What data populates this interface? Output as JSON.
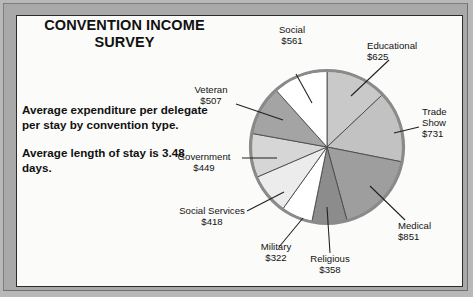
{
  "chart_data": {
    "type": "pie",
    "title": "CONVENTION INCOME SURVEY",
    "categories": [
      "Educational",
      "Trade Show",
      "Medical",
      "Religious",
      "Military",
      "Social Services",
      "Government",
      "Veteran",
      "Social"
    ],
    "values": [
      625,
      731,
      851,
      358,
      322,
      418,
      449,
      507,
      561
    ],
    "value_prefix": "$",
    "total": 4822,
    "xlabel": "",
    "ylabel": "",
    "legend": "none",
    "grid": false,
    "start_angle_deg": 0,
    "direction": "clockwise",
    "slice_colors": [
      "#c9c9c9",
      "#c2c2c2",
      "#9e9e9e",
      "#8c8c8c",
      "#ffffff",
      "#ececec",
      "#d6d6d6",
      "#a4a4a4",
      "#ffffff"
    ],
    "labels": [
      {
        "name": "Educational",
        "value": "$625"
      },
      {
        "name": "Trade Show",
        "value": "$731"
      },
      {
        "name": "Medical",
        "value": "$851"
      },
      {
        "name": "Religious",
        "value": "$358"
      },
      {
        "name": "Military",
        "value": "$322"
      },
      {
        "name": "Social Services",
        "value": "$418"
      },
      {
        "name": "Government",
        "value": "$449"
      },
      {
        "name": "Veteran",
        "value": "$507"
      },
      {
        "name": "Social",
        "value": "$561"
      }
    ],
    "annotations": [
      "Average expenditure per delegate per stay by convention type.",
      "Average length of stay is 3.48 days."
    ]
  },
  "header": {
    "title_line1": "CONVENTION INCOME",
    "title_line2": "SURVEY"
  },
  "caption": {
    "paragraph1": "Average expenditure per delegate per stay by convention type.",
    "paragraph2": "Average length of stay is 3.48 days."
  },
  "callouts": {
    "social": "Social\n$561",
    "educational": "Educational\n$625",
    "trade_show": "Trade\nShow\n$731",
    "medical": "Medical\n$851",
    "religious": "Religious\n$358",
    "military": "Military\n$322",
    "social_services": "Social Services\n$418",
    "government": "Government\n$449",
    "veteran": "Veteran\n$507"
  },
  "colors": {
    "frame": "#a9a9a9",
    "page": "#fbfbfa",
    "ink": "#131313",
    "slice_stroke": "#4a4a4a",
    "rim": "#8a8a8a"
  }
}
